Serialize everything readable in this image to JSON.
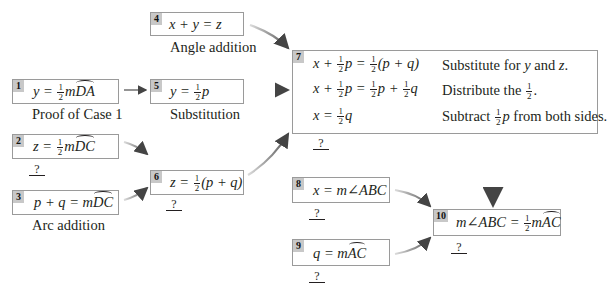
{
  "diagram": {
    "type": "flow-proof",
    "boxes": [
      {
        "id": "1",
        "statement": "y = ½ m arc DA",
        "lhs": "y =",
        "frac": {
          "num": "1",
          "den": "2"
        },
        "tail": "m",
        "arc": "DA",
        "reason": "Proof of Case 1"
      },
      {
        "id": "2",
        "statement": "z = ½ m arc DC",
        "lhs": "z =",
        "frac": {
          "num": "1",
          "den": "2"
        },
        "tail": "m",
        "arc": "DC",
        "reason": "?"
      },
      {
        "id": "3",
        "statement": "p + q = m arc DC",
        "lhs": "p + q = m",
        "arc": "DC",
        "reason": "Arc addition"
      },
      {
        "id": "4",
        "statement": "x + y = z",
        "lhs": "x + y = z",
        "reason": "Angle addition"
      },
      {
        "id": "5",
        "statement": "y = ½p",
        "lhs": "y =",
        "frac": {
          "num": "1",
          "den": "2"
        },
        "tail": "p",
        "reason": "Substitution"
      },
      {
        "id": "6",
        "statement": "z = ½(p + q)",
        "lhs": "z =",
        "frac": {
          "num": "1",
          "den": "2"
        },
        "tail": "(p + q)",
        "reason": "?"
      },
      {
        "id": "7",
        "steps": [
          {
            "statement": "x + ½p = ½(p + q)",
            "a": "x +",
            "b": "p =",
            "c": "(p + q)",
            "reason": "Substitute for y and z.",
            "reason_parts": [
              "Substitute for ",
              "y",
              " and ",
              "z",
              "."
            ]
          },
          {
            "statement": "x + ½p = ½p + ½q",
            "a": "x +",
            "b": "p =",
            "c": "p +",
            "d": "q",
            "reason": "Distribute the ½.",
            "reason_pre": "Distribute the",
            "reason_post": "."
          },
          {
            "statement": "x = ½q",
            "a": "x =",
            "b": "q",
            "reason": "Subtract ½p from both sides.",
            "reason_pre": "Subtract",
            "reason_var": "p",
            "reason_post": " from both sides."
          }
        ],
        "reason": "?"
      },
      {
        "id": "8",
        "statement": "x = m∠ABC",
        "lhs": "x = m∠ABC",
        "reason": "?"
      },
      {
        "id": "9",
        "statement": "q = m arc AC",
        "lhs": "q = m",
        "arc": "AC",
        "reason": "?"
      },
      {
        "id": "10",
        "statement": "m∠ABC = ½ m arc AC",
        "lhs": "m∠ABC =",
        "frac": {
          "num": "1",
          "den": "2"
        },
        "tail": "m",
        "arc": "AC",
        "reason": "?"
      }
    ],
    "edges": [
      {
        "from": "1",
        "to": "5"
      },
      {
        "from": "4",
        "to": "7"
      },
      {
        "from": "5",
        "to": "7"
      },
      {
        "from": "2",
        "to": "6"
      },
      {
        "from": "3",
        "to": "6"
      },
      {
        "from": "6",
        "to": "7"
      },
      {
        "from": "7",
        "to": "10"
      },
      {
        "from": "8",
        "to": "10"
      },
      {
        "from": "9",
        "to": "10"
      }
    ],
    "colors": {
      "border": "#9a9a9a",
      "badge": "#c8c8c8",
      "arrow": "#555555",
      "text": "#231f20"
    }
  }
}
